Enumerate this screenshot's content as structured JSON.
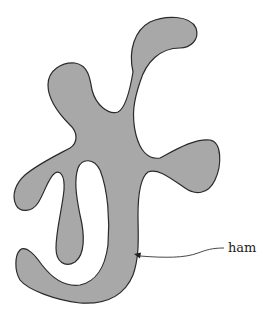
{
  "figure": {
    "region_label": "ham",
    "fill_color": "#a8a8a8",
    "stroke_color": "#2a2a2a",
    "background": "#ffffff"
  }
}
